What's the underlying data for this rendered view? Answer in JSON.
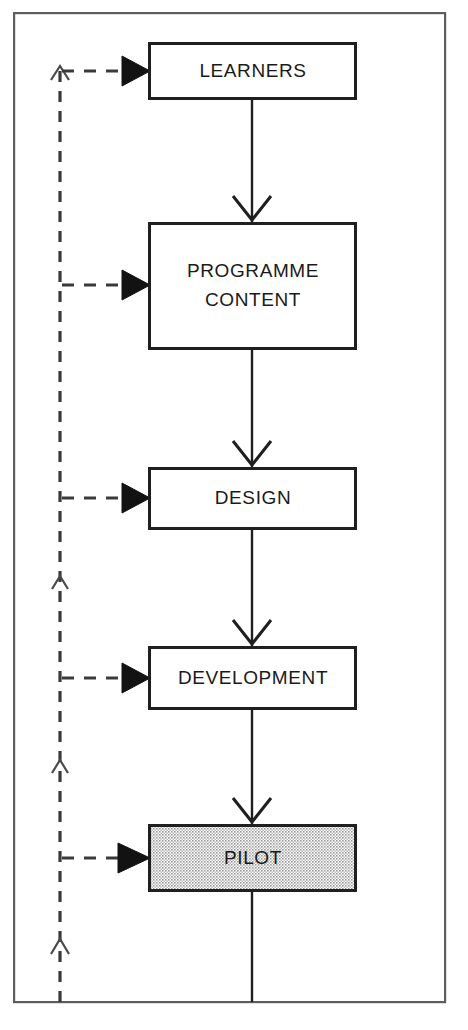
{
  "diagram": {
    "frame": {
      "x": 13,
      "y": 12,
      "width": 433,
      "height": 991
    },
    "colors": {
      "stroke": "#1f1f1f",
      "frame_stroke": "#5d5d5d",
      "dashed_stroke": "#3a3a3a",
      "box_fill": "#ffffff",
      "shaded_box_fill": "#d4d4d4",
      "text": "#1a1a1a"
    },
    "nodes": [
      {
        "id": "learners",
        "label": "LEARNERS",
        "lines": [
          "LEARNERS"
        ],
        "x": 148,
        "y": 42,
        "width": 209,
        "height": 58,
        "shaded": false
      },
      {
        "id": "programme-content",
        "label": "PROGRAMME CONTENT",
        "lines": [
          "PROGRAMME",
          "CONTENT"
        ],
        "x": 148,
        "y": 222,
        "width": 209,
        "height": 128,
        "shaded": false
      },
      {
        "id": "design",
        "label": "DESIGN",
        "lines": [
          "DESIGN"
        ],
        "x": 148,
        "y": 467,
        "width": 209,
        "height": 63,
        "shaded": false
      },
      {
        "id": "development",
        "label": "DEVELOPMENT",
        "lines": [
          "DEVELOPMENT"
        ],
        "x": 148,
        "y": 646,
        "width": 209,
        "height": 64,
        "shaded": false
      },
      {
        "id": "pilot",
        "label": "PILOT",
        "lines": [
          "PILOT"
        ],
        "x": 148,
        "y": 824,
        "width": 209,
        "height": 68,
        "shaded": true
      }
    ],
    "flow_connectors": [
      {
        "from": "learners",
        "to": "programme-content",
        "style": "solid",
        "direction": "down"
      },
      {
        "from": "programme-content",
        "to": "design",
        "style": "solid",
        "direction": "down"
      },
      {
        "from": "design",
        "to": "development",
        "style": "solid",
        "direction": "down"
      },
      {
        "from": "development",
        "to": "pilot",
        "style": "solid",
        "direction": "down"
      },
      {
        "from": "pilot",
        "to": "bottom-frame",
        "style": "solid",
        "direction": "down",
        "arrowhead": false
      }
    ],
    "feedback_loop": {
      "style": "dashed",
      "direction": "upward",
      "spine_x": 60,
      "spine_top_y": 66,
      "spine_bottom_y": 1002,
      "arrowhead_style": "open-caret",
      "branch_arrowhead_style": "filled-triangle",
      "branch_targets": [
        "learners",
        "programme-content",
        "design",
        "development",
        "pilot"
      ],
      "caret_positions_y": [
        70,
        578,
        762,
        942
      ]
    }
  }
}
